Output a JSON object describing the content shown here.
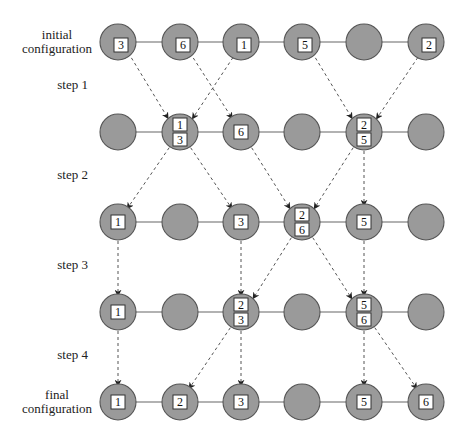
{
  "diagram": {
    "colors": {
      "node_fill": "#9a9a9a",
      "node_stroke": "#555555",
      "line": "#666666",
      "arrow": "#555555",
      "box_fill": "#ffffff",
      "box_stroke": "#333333"
    },
    "columns_x": [
      118,
      180,
      241,
      302,
      364,
      426
    ],
    "rows_y": [
      42,
      132,
      222,
      312,
      402
    ],
    "node_radius": 18,
    "row_labels": [
      {
        "lines": [
          "initial",
          "configuration"
        ],
        "x": 57,
        "y": 42,
        "align": "middle"
      },
      {
        "lines": [
          "final",
          "configuration"
        ],
        "x": 57,
        "y": 402,
        "align": "middle"
      }
    ],
    "step_labels": [
      {
        "text": "step 1",
        "x": 88,
        "y": 89
      },
      {
        "text": "step 2",
        "x": 88,
        "y": 179
      },
      {
        "text": "step 3",
        "x": 88,
        "y": 269
      },
      {
        "text": "step 4",
        "x": 88,
        "y": 359
      }
    ],
    "rows": [
      {
        "name": "initial",
        "offset_labels": true,
        "nodes": [
          [
            "3"
          ],
          [
            "6"
          ],
          [
            "1"
          ],
          [
            "5"
          ],
          [],
          [
            "2"
          ]
        ]
      },
      {
        "name": "after-step-1",
        "offset_labels": false,
        "nodes": [
          [],
          [
            "1",
            "3"
          ],
          [
            "6"
          ],
          [],
          [
            "2",
            "5"
          ],
          []
        ]
      },
      {
        "name": "after-step-2",
        "offset_labels": false,
        "nodes": [
          [
            "1"
          ],
          [],
          [
            "3"
          ],
          [
            "2",
            "6"
          ],
          [
            "5"
          ],
          []
        ]
      },
      {
        "name": "after-step-3",
        "offset_labels": false,
        "nodes": [
          [
            "1"
          ],
          [],
          [
            "2",
            "3"
          ],
          [],
          [
            "5",
            "6"
          ],
          []
        ]
      },
      {
        "name": "final",
        "offset_labels": false,
        "nodes": [
          [
            "1"
          ],
          [
            "2"
          ],
          [
            "3"
          ],
          [],
          [
            "5"
          ],
          [
            "6"
          ]
        ]
      }
    ],
    "moves": [
      {
        "step": 1,
        "packet": "3",
        "from": [
          0,
          0
        ],
        "to": [
          1,
          1
        ],
        "slot": "bottom"
      },
      {
        "step": 1,
        "packet": "6",
        "from": [
          0,
          1
        ],
        "to": [
          1,
          2
        ],
        "slot": "single"
      },
      {
        "step": 1,
        "packet": "1",
        "from": [
          0,
          2
        ],
        "to": [
          1,
          1
        ],
        "slot": "top"
      },
      {
        "step": 1,
        "packet": "5",
        "from": [
          0,
          3
        ],
        "to": [
          1,
          4
        ],
        "slot": "bottom"
      },
      {
        "step": 1,
        "packet": "2",
        "from": [
          0,
          5
        ],
        "to": [
          1,
          4
        ],
        "slot": "top"
      },
      {
        "step": 2,
        "packet": "1",
        "from": [
          1,
          1
        ],
        "to": [
          2,
          0
        ],
        "slot": "single"
      },
      {
        "step": 2,
        "packet": "3",
        "from": [
          1,
          1
        ],
        "to": [
          2,
          2
        ],
        "slot": "single"
      },
      {
        "step": 2,
        "packet": "6",
        "from": [
          1,
          2
        ],
        "to": [
          2,
          3
        ],
        "slot": "bottom"
      },
      {
        "step": 2,
        "packet": "2",
        "from": [
          1,
          4
        ],
        "to": [
          2,
          3
        ],
        "slot": "top"
      },
      {
        "step": 2,
        "packet": "5",
        "from": [
          1,
          4
        ],
        "to": [
          2,
          4
        ],
        "slot": "single"
      },
      {
        "step": 3,
        "packet": "1",
        "from": [
          2,
          0
        ],
        "to": [
          3,
          0
        ],
        "slot": "single"
      },
      {
        "step": 3,
        "packet": "3",
        "from": [
          2,
          2
        ],
        "to": [
          3,
          2
        ],
        "slot": "bottom"
      },
      {
        "step": 3,
        "packet": "2",
        "from": [
          2,
          3
        ],
        "to": [
          3,
          2
        ],
        "slot": "top"
      },
      {
        "step": 3,
        "packet": "6",
        "from": [
          2,
          3
        ],
        "to": [
          3,
          4
        ],
        "slot": "bottom"
      },
      {
        "step": 3,
        "packet": "5",
        "from": [
          2,
          4
        ],
        "to": [
          3,
          4
        ],
        "slot": "top"
      },
      {
        "step": 4,
        "packet": "1",
        "from": [
          3,
          0
        ],
        "to": [
          4,
          0
        ],
        "slot": "single"
      },
      {
        "step": 4,
        "packet": "2",
        "from": [
          3,
          2
        ],
        "to": [
          4,
          1
        ],
        "slot": "single"
      },
      {
        "step": 4,
        "packet": "3",
        "from": [
          3,
          2
        ],
        "to": [
          4,
          2
        ],
        "slot": "single"
      },
      {
        "step": 4,
        "packet": "5",
        "from": [
          3,
          4
        ],
        "to": [
          4,
          4
        ],
        "slot": "single"
      },
      {
        "step": 4,
        "packet": "6",
        "from": [
          3,
          4
        ],
        "to": [
          4,
          5
        ],
        "slot": "single"
      }
    ]
  }
}
